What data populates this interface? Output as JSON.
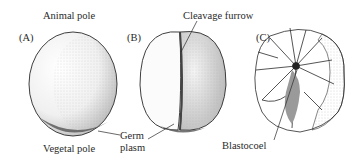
{
  "figure": {
    "panels": [
      {
        "id": "A",
        "label": "(A)",
        "stage": "uncleaved egg"
      },
      {
        "id": "B",
        "label": "(B)",
        "stage": "first cleavage"
      },
      {
        "id": "C",
        "label": "(C)",
        "stage": "cleaved embryo with blastocoel"
      }
    ],
    "annotations": {
      "animal_pole": "Animal pole",
      "vegetal_pole": "Vegetal pole",
      "cleavage_furrow": "Cleavage furrow",
      "germ_plasm_line1": "Germ",
      "germ_plasm_line2": "plasm",
      "blastocoel": "Blastocoel"
    },
    "colors": {
      "outline": "#2a2a2a",
      "stipple": "#6a6a6a",
      "germ_plasm": "#555555",
      "cavity": "#3a3a3a"
    }
  }
}
